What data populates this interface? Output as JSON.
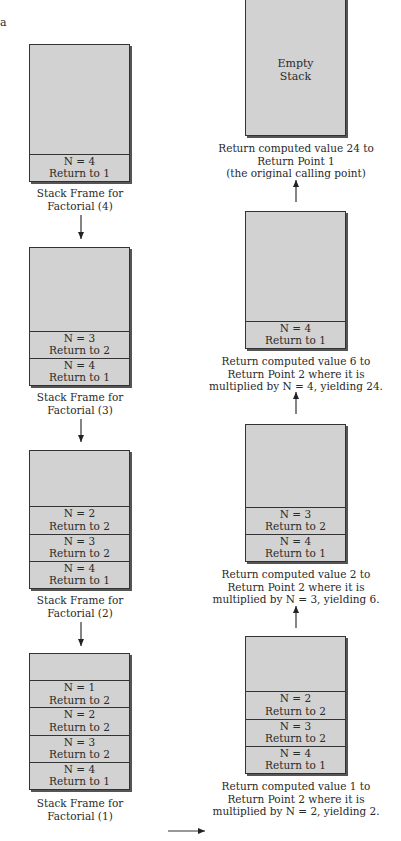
{
  "corner_label": "a",
  "left_column": [
    {
      "top": 44,
      "height": 138,
      "frames": [
        {
          "n": "N = 4",
          "ret": "Return to 1"
        }
      ],
      "caption": [
        "Stack Frame for",
        "Factorial (4)"
      ],
      "caption_top": 187
    },
    {
      "top": 247,
      "height": 139,
      "frames": [
        {
          "n": "N = 3",
          "ret": "Return to 2"
        },
        {
          "n": "N = 4",
          "ret": "Return to 1"
        }
      ],
      "caption": [
        "Stack Frame for",
        "Factorial (3)"
      ],
      "caption_top": 391
    },
    {
      "top": 450,
      "height": 139,
      "frames": [
        {
          "n": "N = 2",
          "ret": "Return to 2"
        },
        {
          "n": "N = 3",
          "ret": "Return to 2"
        },
        {
          "n": "N = 4",
          "ret": "Return to 1"
        }
      ],
      "caption": [
        "Stack Frame for",
        "Factorial (2)"
      ],
      "caption_top": 594
    },
    {
      "top": 653,
      "height": 137,
      "frames": [
        {
          "n": "N = 1",
          "ret": "Return to 2"
        },
        {
          "n": "N = 2",
          "ret": "Return to 2"
        },
        {
          "n": "N = 3",
          "ret": "Return to 2"
        },
        {
          "n": "N = 4",
          "ret": "Return to 1"
        }
      ],
      "caption": [
        "Stack Frame for",
        "Factorial (1)"
      ],
      "caption_top": 797
    }
  ],
  "right_column": [
    {
      "top": -2,
      "height": 138,
      "empty_label": [
        "Empty",
        "Stack"
      ],
      "frames": [],
      "caption": [
        "Return computed value 24 to",
        "Return Point 1",
        "(the original calling point)"
      ],
      "caption_top": 142
    },
    {
      "top": 211,
      "height": 138,
      "frames": [
        {
          "n": "N = 4",
          "ret": "Return to 1"
        }
      ],
      "caption": [
        "Return computed value 6 to",
        "Return Point 2 where it is",
        "multiplied by N = 4, yielding 24."
      ],
      "caption_top": 355
    },
    {
      "top": 424,
      "height": 138,
      "frames": [
        {
          "n": "N = 3",
          "ret": "Return to 2"
        },
        {
          "n": "N = 4",
          "ret": "Return to 1"
        }
      ],
      "caption": [
        "Return computed value 2 to",
        "Return Point 2 where it is",
        "multiplied by N = 3, yielding 6."
      ],
      "caption_top": 568
    },
    {
      "top": 636,
      "height": 138,
      "frames": [
        {
          "n": "N = 2",
          "ret": "Return to 2"
        },
        {
          "n": "N = 3",
          "ret": "Return to 2"
        },
        {
          "n": "N = 4",
          "ret": "Return to 1"
        }
      ],
      "caption": [
        "Return computed value 1 to",
        "Return Point 2 where it is",
        "multiplied by N = 2, yielding 2."
      ],
      "caption_top": 780
    }
  ],
  "colors": {
    "box_fill": "#d2d2d2",
    "border": "#333333",
    "text": "#2a2a2a"
  }
}
